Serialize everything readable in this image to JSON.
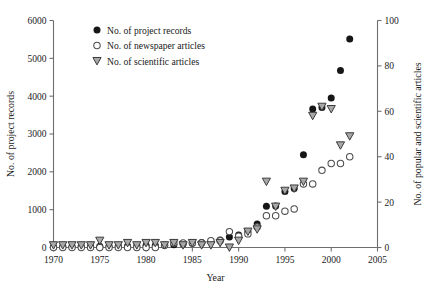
{
  "chart_data": {
    "type": "scatter",
    "title": "",
    "xlabel": "Year",
    "ylabel": "No. of project records",
    "y2label": "No. of popular and scientific articles",
    "xlim": [
      1970,
      2005
    ],
    "ylim": [
      0,
      6000
    ],
    "y2lim": [
      0,
      100
    ],
    "xticks": [
      1970,
      1975,
      1980,
      1985,
      1990,
      1995,
      2000,
      2005
    ],
    "yticks": [
      0,
      1000,
      2000,
      3000,
      4000,
      5000,
      6000
    ],
    "y2ticks": [
      0,
      20,
      40,
      60,
      80,
      100
    ],
    "grid": false,
    "legend_position": "top-left-inside",
    "series": [
      {
        "name": "No. of project records",
        "marker": "filled-circle",
        "axis": "left",
        "color": "#161616",
        "x": [
          1970,
          1971,
          1972,
          1973,
          1974,
          1975,
          1976,
          1977,
          1978,
          1979,
          1980,
          1981,
          1982,
          1983,
          1984,
          1985,
          1986,
          1987,
          1988,
          1989,
          1990,
          1991,
          1992,
          1993,
          1994,
          1995,
          1996,
          1997,
          1998,
          1999,
          2000,
          2001,
          2002
        ],
        "values": [
          20,
          25,
          25,
          30,
          30,
          35,
          35,
          40,
          40,
          45,
          50,
          55,
          60,
          70,
          90,
          110,
          130,
          160,
          200,
          280,
          330,
          420,
          620,
          1090,
          1100,
          1480,
          1560,
          2450,
          3660,
          3700,
          3950,
          4680,
          5510
        ]
      },
      {
        "name": "No. of newspaper articles",
        "marker": "open-circle",
        "axis": "right",
        "color": "#4d4d4d",
        "x": [
          1970,
          1971,
          1972,
          1973,
          1974,
          1975,
          1976,
          1977,
          1978,
          1979,
          1980,
          1981,
          1982,
          1983,
          1984,
          1985,
          1986,
          1987,
          1988,
          1989,
          1990,
          1991,
          1992,
          1993,
          1994,
          1995,
          1996,
          1997,
          1998,
          1999,
          2000,
          2001,
          2002
        ],
        "values": [
          0,
          0,
          0,
          0,
          0,
          0,
          0,
          0,
          0,
          0,
          0,
          0,
          1,
          2,
          2,
          2,
          2,
          3,
          3,
          7,
          5,
          6,
          9,
          14,
          14,
          16,
          17,
          28,
          28,
          34,
          37,
          37,
          40
        ]
      },
      {
        "name": "No. of scientific articles",
        "marker": "open-triangle-down",
        "axis": "right",
        "color": "#a8a8a8",
        "x": [
          1970,
          1971,
          1972,
          1973,
          1974,
          1975,
          1976,
          1977,
          1978,
          1979,
          1980,
          1981,
          1982,
          1983,
          1984,
          1985,
          1986,
          1987,
          1988,
          1989,
          1990,
          1991,
          1992,
          1993,
          1994,
          1995,
          1996,
          1997,
          1998,
          1999,
          2000,
          2001,
          2002
        ],
        "values": [
          1,
          1,
          1,
          1,
          1,
          3,
          1,
          1,
          2,
          1,
          2,
          2,
          1,
          2,
          1,
          2,
          1,
          1,
          2,
          0,
          3,
          7,
          8,
          29,
          18,
          25,
          26,
          29,
          58,
          62,
          61,
          45,
          49
        ]
      }
    ],
    "legend": [
      {
        "label": "No. of project records",
        "marker": "filled-circle"
      },
      {
        "label": "No. of newspaper articles",
        "marker": "open-circle"
      },
      {
        "label": "No. of scientific articles",
        "marker": "open-triangle-down"
      }
    ]
  }
}
